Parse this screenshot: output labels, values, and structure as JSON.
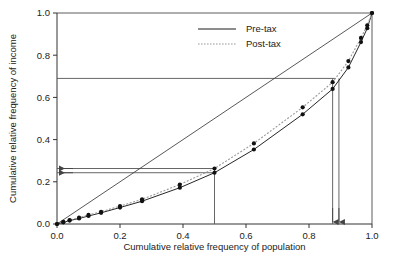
{
  "chart_data": {
    "type": "line",
    "title": "",
    "subtitle": "",
    "xlabel": "Cumulative relative frequency of population",
    "ylabel": "Cumulative relative frequency of income",
    "xlim": [
      0.0,
      1.0
    ],
    "ylim": [
      0.0,
      1.0
    ],
    "xticks": [
      "0.0",
      "0.2",
      "0.4",
      "0.6",
      "0.8",
      "1.0"
    ],
    "xtick_values": [
      0.0,
      0.2,
      0.4,
      0.6,
      0.8,
      1.0
    ],
    "yticks": [
      "0.0",
      "0.2",
      "0.4",
      "0.6",
      "0.8",
      "1.0"
    ],
    "ytick_values": [
      0.0,
      0.2,
      0.4,
      0.6,
      0.8,
      1.0
    ],
    "grid": false,
    "legend_position": "top-center",
    "series": [
      {
        "name": "Pre-tax",
        "style": "solid",
        "marker": "filled-circle",
        "x": [
          0.0,
          0.02,
          0.04,
          0.07,
          0.1,
          0.14,
          0.2,
          0.27,
          0.39,
          0.5,
          0.625,
          0.78,
          0.875,
          0.925,
          0.965,
          0.985,
          1.0
        ],
        "y": [
          0.0,
          0.008,
          0.016,
          0.026,
          0.038,
          0.053,
          0.078,
          0.108,
          0.172,
          0.243,
          0.353,
          0.52,
          0.64,
          0.742,
          0.862,
          0.928,
          1.0
        ]
      },
      {
        "name": "Post-tax",
        "style": "dotted",
        "marker": "filled-circle",
        "x": [
          0.0,
          0.02,
          0.04,
          0.07,
          0.1,
          0.14,
          0.2,
          0.27,
          0.39,
          0.5,
          0.625,
          0.78,
          0.875,
          0.925,
          0.965,
          0.985,
          1.0
        ],
        "y": [
          0.0,
          0.01,
          0.019,
          0.03,
          0.043,
          0.058,
          0.085,
          0.117,
          0.187,
          0.263,
          0.382,
          0.553,
          0.672,
          0.772,
          0.882,
          0.942,
          1.0
        ]
      },
      {
        "name": "Line of equality",
        "style": "solid",
        "marker": "none",
        "x": [
          0.0,
          1.0
        ],
        "y": [
          0.0,
          1.0
        ]
      }
    ],
    "annotations": [
      {
        "kind": "horizontal-reference-line",
        "y": 0.69,
        "x_from": 0.0,
        "x_to": 0.885
      },
      {
        "kind": "vertical-reference-line",
        "x": 0.875,
        "y_from": 0.0,
        "y_to": 0.69
      },
      {
        "kind": "vertical-reference-line",
        "x": 0.895,
        "y_from": 0.0,
        "y_to": 0.69
      },
      {
        "kind": "horizontal-reference-line",
        "y": 0.263,
        "x_from": 0.0,
        "x_to": 0.5
      },
      {
        "kind": "horizontal-reference-line",
        "y": 0.243,
        "x_from": 0.0,
        "x_to": 0.5
      },
      {
        "kind": "vertical-reference-line",
        "x": 0.5,
        "y_from": 0.0,
        "y_to": 0.263
      },
      {
        "kind": "arrow-left",
        "y": 0.263,
        "x": 0.0
      },
      {
        "kind": "arrow-left",
        "y": 0.243,
        "x": 0.0
      },
      {
        "kind": "arrow-down",
        "x": 0.875,
        "y": 0.0
      },
      {
        "kind": "arrow-down",
        "x": 0.895,
        "y": 0.0
      }
    ]
  },
  "legend": {
    "items": [
      {
        "label": "Pre-tax",
        "style": "solid"
      },
      {
        "label": "Post-tax",
        "style": "dotted"
      }
    ]
  },
  "colors": {
    "axis": "#333333",
    "pre_tax": "#1a1a1a",
    "post_tax": "#9a9a9a",
    "reference": "#555555",
    "background": "#ffffff"
  }
}
